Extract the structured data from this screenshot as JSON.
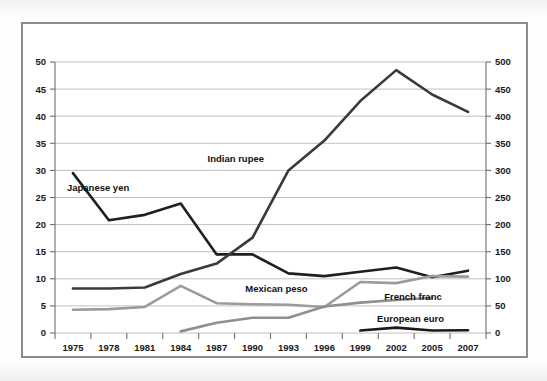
{
  "chart_data": {
    "type": "line",
    "title": "",
    "subtitle": "",
    "xlabel": "",
    "ylabel": "",
    "y2label": "",
    "x": [
      1975,
      1978,
      1981,
      1984,
      1987,
      1990,
      1993,
      1996,
      1999,
      2002,
      2005,
      2007
    ],
    "categories": [
      "1975",
      "1978",
      "1981",
      "1984",
      "1987",
      "1990",
      "1993",
      "1996",
      "1999",
      "2002",
      "2005",
      "2007"
    ],
    "ylim": [
      0,
      50
    ],
    "y2lim": [
      0,
      500
    ],
    "yticks": [
      0,
      5,
      10,
      15,
      20,
      25,
      30,
      35,
      40,
      45,
      50
    ],
    "y2ticks": [
      0,
      50,
      100,
      150,
      200,
      250,
      300,
      350,
      400,
      450,
      500
    ],
    "ytick_labels": [
      "0",
      "5",
      "10",
      "15",
      "20",
      "25",
      "30",
      "35",
      "40",
      "45",
      "50"
    ],
    "y2tick_labels": [
      "0",
      "50",
      "100",
      "150",
      "200",
      "250",
      "300",
      "350",
      "400",
      "450",
      "500"
    ],
    "grid": true,
    "grid_axis": "y",
    "legend_position": "inline-labels",
    "series": [
      {
        "name": "Japanese yen",
        "color": "#1f1f1f",
        "width": 2.6,
        "axis": "left",
        "label_x": 1977.1,
        "label_y": 26.2,
        "values": [
          29.5,
          20.8,
          21.8,
          23.9,
          14.5,
          14.5,
          11.0,
          10.5,
          11.3,
          12.1,
          10.3,
          11.5
        ]
      },
      {
        "name": "Indian rupee",
        "color": "#3a3a3a",
        "width": 2.6,
        "axis": "left",
        "label_x": 1988.6,
        "label_y": 31.6,
        "values": [
          8.2,
          8.2,
          8.4,
          10.9,
          12.8,
          17.6,
          30.0,
          35.5,
          42.8,
          48.5,
          44.0,
          40.8
        ]
      },
      {
        "name": "Mexican peso",
        "color": "#9b9b9b",
        "width": 2.6,
        "axis": "left",
        "label_x": 1992.0,
        "label_y": 7.6,
        "values": [
          4.3,
          4.4,
          4.8,
          8.7,
          5.5,
          5.3,
          5.2,
          4.8,
          9.4,
          9.2,
          10.5,
          10.4
        ]
      },
      {
        "name": "French franc",
        "color": "#8f8f8f",
        "width": 2.6,
        "axis": "left",
        "label_x": 2003.4,
        "label_y": 6.0,
        "values": [
          null,
          null,
          null,
          0.3,
          1.9,
          2.8,
          2.8,
          4.9,
          5.6,
          6.1,
          6.5,
          null
        ]
      },
      {
        "name": "European euro",
        "color": "#1a1a1a",
        "width": 2.6,
        "axis": "left",
        "label_x": 2003.2,
        "label_y": 2.1,
        "values": [
          null,
          null,
          null,
          null,
          null,
          null,
          null,
          null,
          0.45,
          1.0,
          0.45,
          0.5
        ]
      }
    ]
  }
}
